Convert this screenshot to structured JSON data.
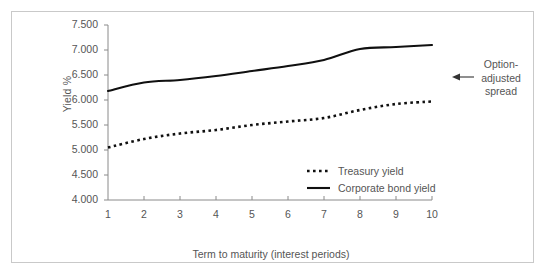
{
  "chart_data": {
    "type": "line",
    "title": "",
    "xlabel": "Term to maturity (interest periods)",
    "ylabel": "Yield %",
    "x": [
      1,
      2,
      3,
      4,
      5,
      6,
      7,
      8,
      9,
      10
    ],
    "xlim": [
      1,
      10
    ],
    "ylim": [
      4.0,
      7.5
    ],
    "grid": false,
    "legend_position": "inside-lower-right",
    "y_ticks": [
      "4.000",
      "4.500",
      "5.000",
      "5.500",
      "6.000",
      "6.500",
      "7.000",
      "7.500"
    ],
    "y_tick_values": [
      4.0,
      4.5,
      5.0,
      5.5,
      6.0,
      6.5,
      7.0,
      7.5
    ],
    "x_ticks": [
      "1",
      "2",
      "3",
      "4",
      "5",
      "6",
      "7",
      "8",
      "9",
      "10"
    ],
    "series": [
      {
        "name": "Treasury yield",
        "style": "dotted",
        "color": "#101010",
        "values": [
          5.05,
          5.22,
          5.33,
          5.4,
          5.5,
          5.57,
          5.64,
          5.8,
          5.92,
          5.97
        ]
      },
      {
        "name": "Corporate bond yield",
        "style": "solid",
        "color": "#101010",
        "values": [
          6.18,
          6.35,
          6.4,
          6.48,
          6.58,
          6.68,
          6.8,
          7.02,
          7.06,
          7.1
        ]
      }
    ],
    "annotations": [
      {
        "text": "Option-adjusted spread",
        "lines": [
          "Option-",
          "adjusted",
          "spread"
        ],
        "arrow": "left-arrow"
      }
    ]
  },
  "legend": {
    "items": [
      {
        "label": "Treasury yield",
        "style": "dotted"
      },
      {
        "label": "Corporate bond yield",
        "style": "solid"
      }
    ]
  },
  "axes": {
    "y_label": "Yield %",
    "x_label": "Term to maturity (interest periods)"
  }
}
